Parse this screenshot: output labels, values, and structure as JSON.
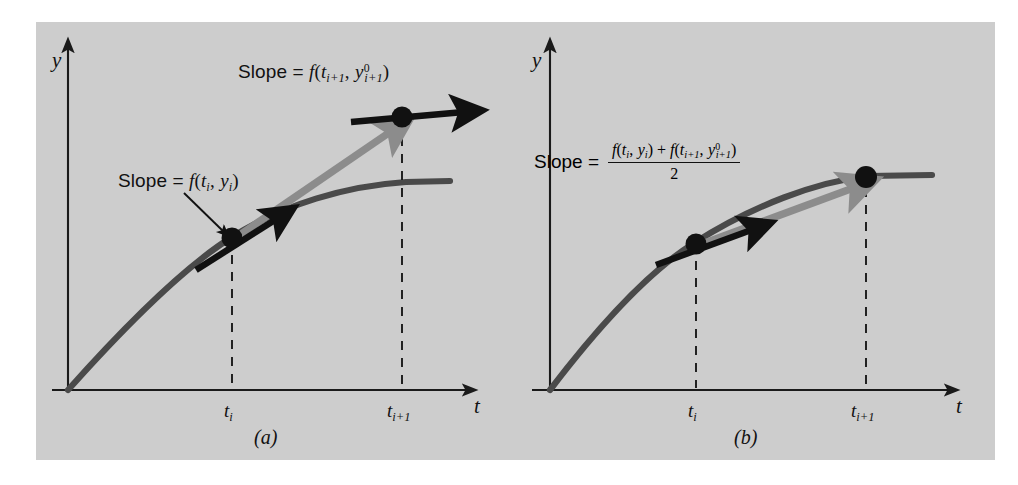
{
  "figure": {
    "kind": "diagram",
    "background_color": "#cdcdcd",
    "page_color": "#ffffff",
    "curve_color": "#4a4a4a",
    "tangent_color": "#111111",
    "secant_color": "#8c8c8c",
    "point_color": "#111111"
  },
  "panels": [
    {
      "id": "a",
      "caption": "(a)",
      "axes": {
        "y_label": "y",
        "x_label": "t",
        "x_ticks": [
          {
            "label_plain": "ti",
            "base": "t",
            "sub": "i"
          },
          {
            "label_plain": "ti+1",
            "base": "t",
            "sub": "i+1"
          }
        ]
      },
      "annotations": [
        {
          "name": "slope-at-predicted-point",
          "text_plain": "Slope = f(ti+1, y0i+1)",
          "prefix": "Slope =",
          "func": "f",
          "arg1_base": "t",
          "arg1_sub": "i+1",
          "arg2_base": "y",
          "arg2_sup": "0",
          "arg2_sub": "i+1"
        },
        {
          "name": "slope-at-current-point",
          "text_plain": "Slope = f(ti, yi)",
          "prefix": "Slope =",
          "func": "f",
          "arg1_base": "t",
          "arg1_sub": "i",
          "arg2_base": "y",
          "arg2_sub": "i"
        }
      ]
    },
    {
      "id": "b",
      "caption": "(b)",
      "axes": {
        "y_label": "y",
        "x_label": "t",
        "x_ticks": [
          {
            "label_plain": "ti",
            "base": "t",
            "sub": "i"
          },
          {
            "label_plain": "ti+1",
            "base": "t",
            "sub": "i+1"
          }
        ]
      },
      "annotations": [
        {
          "name": "averaged-slope-formula",
          "text_plain": "Slope = ( f(ti, yi) + f(ti+1, y0i+1) ) / 2",
          "prefix": "Slope =",
          "numerator_plain": "f(ti, yi) + f(ti+1, y0i+1)",
          "denominator": "2",
          "term1_func": "f",
          "term1_arg1_base": "t",
          "term1_arg1_sub": "i",
          "term1_arg2_base": "y",
          "term1_arg2_sub": "i",
          "plus": "+",
          "term2_func": "f",
          "term2_arg1_base": "t",
          "term2_arg1_sub": "i+1",
          "term2_arg2_base": "y",
          "term2_arg2_sup": "0",
          "term2_arg2_sub": "i+1"
        }
      ]
    }
  ],
  "symbols": {
    "slope_word": "Slope",
    "equals": "=",
    "open_paren": "(",
    "close_paren": ")",
    "comma": ",",
    "plus": "+",
    "two": "2",
    "f": "f",
    "t": "t",
    "y": "y",
    "sub_i": "i",
    "sub_i_plus_1": "i+1",
    "sup_zero": "0"
  }
}
